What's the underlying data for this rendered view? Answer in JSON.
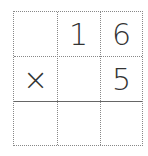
{
  "grid": {
    "rows": 3,
    "cols": 3,
    "cells": [
      [
        "",
        "1",
        "6"
      ],
      [
        "×",
        "",
        "5"
      ],
      [
        "",
        "",
        ""
      ]
    ]
  }
}
